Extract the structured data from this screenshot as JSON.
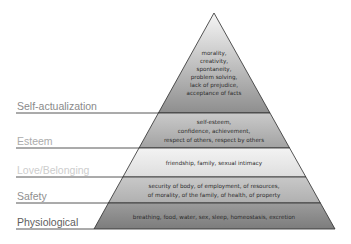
{
  "diagram": {
    "type": "pyramid",
    "levels": [
      {
        "name": "Self-actualization",
        "label_color": "#8a8a8a",
        "fill_top": "#f4f4f4",
        "fill_bottom": "#8c8c8c",
        "lines": [
          "morality,",
          "creativity,",
          "spontaneity,",
          "problem solving,",
          "lack of prejudice,",
          "acceptance of facts"
        ]
      },
      {
        "name": "Esteem",
        "label_color": "#ababab",
        "fill_top": "#c8c8c8",
        "fill_bottom": "#a4a4a4",
        "lines": [
          "self-esteem,",
          "confidence, achievement,",
          "respect of others, respect by others"
        ]
      },
      {
        "name": "Love/Belonging",
        "label_color": "#cdcdcd",
        "fill_top": "#f2f2f2",
        "fill_bottom": "#e0e0e0",
        "lines": [
          "friendship, family, sexual intimacy"
        ]
      },
      {
        "name": "Safety",
        "label_color": "#8f8f8f",
        "fill_top": "#c6c6c6",
        "fill_bottom": "#b2b2b2",
        "lines": [
          "security of body, of employment, of resources,",
          "of morality, of the family, of health, of property"
        ]
      },
      {
        "name": "Physiological",
        "label_color": "#5e5e5e",
        "fill_top": "#9a9a9a",
        "fill_bottom": "#7e7e7e",
        "lines": [
          "breathing, food, water, sex, sleep, homeostasis, excretion"
        ]
      }
    ]
  }
}
